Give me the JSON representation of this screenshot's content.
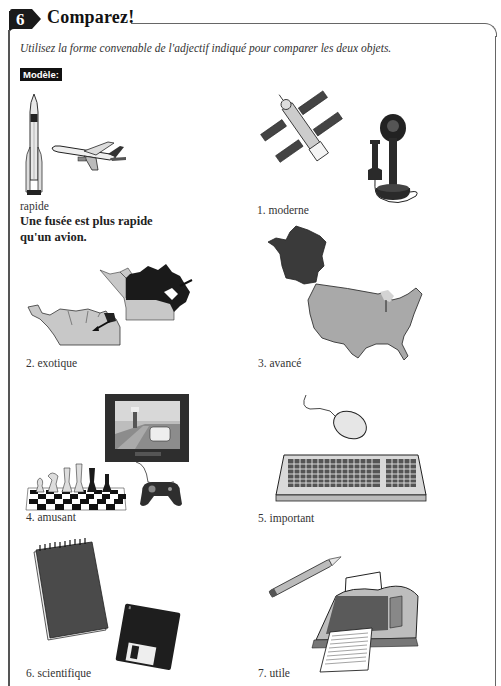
{
  "exercise": {
    "number": "6",
    "title": "Comparez!",
    "instructions": "Utilisez la forme convenable de l'adjectif indiqué pour comparer les deux objets.",
    "model_label": "Modèle:"
  },
  "model": {
    "adjective": "rapide",
    "answer_line1": "Une fusée est plus rapide",
    "answer_line2": "qu'un avion.",
    "images": [
      "rocket-icon",
      "airplane-icon"
    ]
  },
  "items": [
    {
      "label": "1.  moderne",
      "images": [
        "satellite-icon",
        "candlestick-telephone-icon"
      ]
    },
    {
      "label": "2.  exotique",
      "images": [
        "south-america-map-icon",
        "canada-map-icon"
      ]
    },
    {
      "label": "3.  avancé",
      "images": [
        "france-map-icon",
        "usa-map-icon"
      ]
    },
    {
      "label": "4.  amusant",
      "images": [
        "chess-set-icon",
        "video-game-tv-icon"
      ]
    },
    {
      "label": "5.  important",
      "images": [
        "computer-mouse-icon",
        "keyboard-icon"
      ]
    },
    {
      "label": "6.  scientifique",
      "images": [
        "notepad-icon",
        "floppy-disk-icon"
      ]
    },
    {
      "label": "7.  utile",
      "images": [
        "pencil-icon",
        "printer-icon"
      ]
    }
  ],
  "colors": {
    "badge": "#1a1a1a",
    "border": "#666666",
    "map_gray": "#a8a8a8",
    "dark_fill": "#333333"
  }
}
